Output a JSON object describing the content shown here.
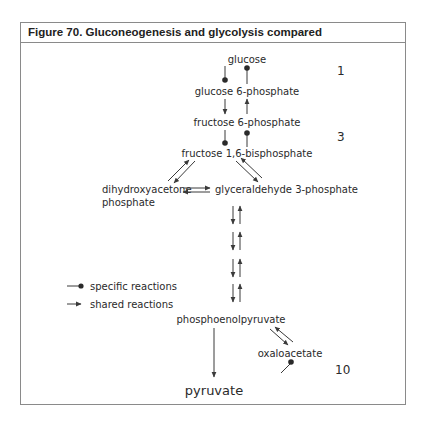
{
  "figure": {
    "title": "Figure 70. Gluconeogenesis and glycolysis compared"
  },
  "metabolites": {
    "glucose": "glucose",
    "glucose_6_phosphate": "glucose 6-phosphate",
    "fructose_6_phosphate": "fructose 6-phosphate",
    "fructose_1_6_bisphosphate": "fructose 1,6-bisphosphate",
    "dihydroxyacetone_phosphate_line1": "dihydroxyacetone",
    "dihydroxyacetone_phosphate_line2": "phosphate",
    "glyceraldehyde_3_phosphate": "glyceraldehyde 3-phosphate",
    "phosphoenolpyruvate": "phosphoenolpyruvate",
    "oxaloacetate": "oxaloacetate",
    "pyruvate": "pyruvate"
  },
  "step_numbers": {
    "step_1": "1",
    "step_3": "3",
    "step_10": "10"
  },
  "legend": {
    "items": [
      {
        "symbol": "line-dot",
        "label": "specific reactions"
      },
      {
        "symbol": "line-arrow",
        "label": "shared reactions"
      }
    ]
  },
  "colors": {
    "line": "#3a3a3a",
    "text": "#2a2a2a",
    "frame": "#8a8a8a"
  }
}
